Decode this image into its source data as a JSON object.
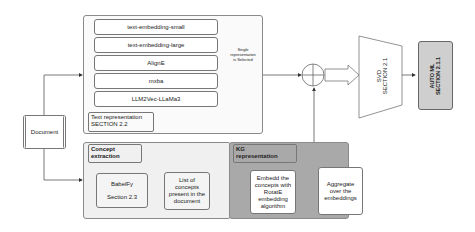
{
  "document": {
    "label": "Document"
  },
  "text_panel": {
    "models": [
      "text-embedding-small",
      "text-embedding-large",
      "AlignE",
      "mxba",
      "LLM2Vec-LLaMa3"
    ],
    "label_line1": "Text representation",
    "label_line2": "SECTION 2.2",
    "selector_note_line1": "Single",
    "selector_note_line2": "representation",
    "selector_note_line3": "is Selected"
  },
  "concept_panel": {
    "label_line1": "Concept",
    "label_line2": "extraction",
    "babelfy_line1": "BabelFy",
    "babelfy_line2": "Section 2.3",
    "list_line1": "List of",
    "list_line2": "concepts",
    "list_line3": "present in the",
    "list_line4": "document"
  },
  "kg_panel": {
    "label_line1": "KG",
    "label_line2": "representation",
    "embed_line1": "Embedd the",
    "embed_line2": "concepts with",
    "embed_line3": "RotatE",
    "embed_line4": "embedding",
    "embed_line5": "algorithm",
    "aggregate_line1": "Aggregate",
    "aggregate_line2": "over the",
    "aggregate_line3": "embeddings"
  },
  "svd": {
    "line1": "SVD",
    "line2": "SECTION 2.1"
  },
  "automl": {
    "line1": "AUTO ML",
    "line2": "SECTION 2.1.1"
  },
  "colors": {
    "kg_fill": "#a9a9a9",
    "concept_fill": "#f0f0f0",
    "automl_fill": "#cfcfcf",
    "stroke": "#777777"
  }
}
